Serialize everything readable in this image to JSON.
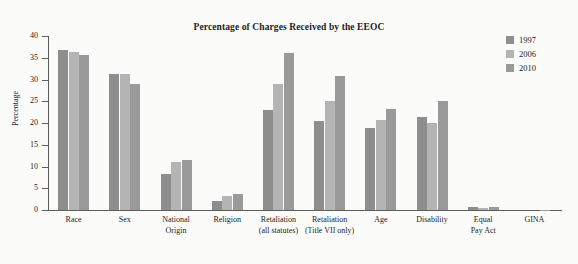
{
  "chart_data": {
    "type": "bar",
    "title": "Percentage of Charges Received by the EEOC",
    "xlabel": "",
    "ylabel": "Percentage",
    "ylim": [
      0,
      40
    ],
    "ytick_values": [
      0,
      5,
      10,
      15,
      20,
      25,
      30,
      35,
      40
    ],
    "ytick_labels": [
      "0",
      "5",
      "10",
      "15",
      "20",
      "25",
      "30",
      "35",
      "40"
    ],
    "grid": false,
    "legend_position": "top-right",
    "categories": [
      "Race",
      "Sex",
      "National Origin",
      "Religion",
      "Retaliation (all statutes)",
      "Retaliation (Title VII only)",
      "Age",
      "Disability",
      "Equal Pay Act",
      "GINA"
    ],
    "category_lines": [
      [
        "Race",
        ""
      ],
      [
        "Sex",
        ""
      ],
      [
        "National",
        "Origin"
      ],
      [
        "Religion",
        ""
      ],
      [
        "Retaliation",
        "(all statutes)"
      ],
      [
        "Retaliation",
        "(Title VII only)"
      ],
      [
        "Age",
        ""
      ],
      [
        "Disability",
        ""
      ],
      [
        "Equal",
        "Pay Act"
      ],
      [
        "GINA",
        ""
      ]
    ],
    "series": [
      {
        "name": "1997",
        "color": "#8e8e8e",
        "values": [
          36.9,
          31.3,
          8.3,
          2.0,
          22.9,
          20.4,
          18.9,
          21.4,
          0.8,
          0.0
        ]
      },
      {
        "name": "2006",
        "color": "#b4b4b4",
        "values": [
          36.4,
          31.2,
          11.0,
          3.2,
          29.0,
          25.1,
          20.8,
          20.1,
          0.5,
          0.0
        ]
      },
      {
        "name": "2010",
        "color": "#9a9a9a",
        "values": [
          35.6,
          28.9,
          11.4,
          3.6,
          36.1,
          30.7,
          23.2,
          25.0,
          0.6,
          0.1
        ]
      }
    ]
  },
  "axis": {
    "line_color": "#5d5d5d",
    "text_color": "#1d1d1d"
  },
  "figure": {
    "background": "#fbfbfa"
  }
}
